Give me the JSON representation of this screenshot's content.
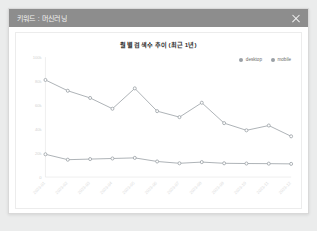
{
  "window": {
    "title": "키워드 : 머신러닝",
    "close_icon": "close-icon"
  },
  "colors": {
    "header_bg": "#8d8d8d",
    "header_text": "#f2f2f2",
    "modal_bg": "#ffffff",
    "page_bg": "#ebecec",
    "desktop_line": "#9aa0a6",
    "mobile_line": "#9aa0a6",
    "axis": "#e8e8e8",
    "tick_text": "#d2d2d2"
  },
  "chart_data": {
    "type": "line",
    "title": "월별 검색수 추이 (최근 1년)",
    "xlabel": "",
    "ylabel": "",
    "grid": false,
    "legend_position": "top-right",
    "categories": [
      "2023-01",
      "2023-02",
      "2023-03",
      "2023-04",
      "2023-05",
      "2023-06",
      "2023-07",
      "2023-08",
      "2023-09",
      "2023-10",
      "2023-11",
      "2023-12"
    ],
    "x_tick_labels": [
      "2023-01",
      "2023-02",
      "2023-03",
      "2023-04",
      "2023-05",
      "2023-06",
      "2023-07",
      "2023-08",
      "2023-09",
      "2023-10",
      "2023-11",
      "2023-12"
    ],
    "y_tick_labels": [
      "0",
      "20k",
      "40k",
      "60k",
      "80k",
      "100k"
    ],
    "y_tick_values": [
      0,
      20000,
      40000,
      60000,
      80000,
      100000
    ],
    "ylim": [
      0,
      100000
    ],
    "series": [
      {
        "name": "desktop",
        "color": "#9aa0a6",
        "values": [
          81000,
          72000,
          66000,
          57000,
          74000,
          55000,
          50000,
          62000,
          45000,
          39000,
          43000,
          34000
        ]
      },
      {
        "name": "mobile",
        "color": "#9aa0a6",
        "values": [
          19000,
          14500,
          15000,
          15500,
          16000,
          13000,
          11500,
          12500,
          11500,
          11300,
          11200,
          11000
        ]
      }
    ]
  }
}
